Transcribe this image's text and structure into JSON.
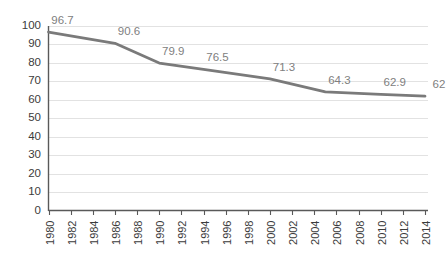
{
  "chart_data": {
    "type": "line",
    "title": "",
    "subtitle": "",
    "xlabel": "",
    "ylabel": "",
    "grid": true,
    "legend": false,
    "xlim": [
      1980,
      2014
    ],
    "ylim": [
      0,
      100
    ],
    "y_ticks": [
      0,
      10,
      20,
      30,
      40,
      50,
      60,
      70,
      80,
      90,
      100
    ],
    "y_tick_labels": [
      "0",
      "10",
      "20",
      "30",
      "40",
      "50",
      "60",
      "70",
      "80",
      "90",
      "100"
    ],
    "x_ticks": [
      1980,
      1982,
      1984,
      1986,
      1988,
      1990,
      1992,
      1994,
      1996,
      1998,
      2000,
      2002,
      2004,
      2006,
      2008,
      2010,
      2012,
      2014
    ],
    "x_tick_labels": [
      "1980",
      "1982",
      "1984",
      "1986",
      "1988",
      "1990",
      "1992",
      "1994",
      "1996",
      "1998",
      "2000",
      "2002",
      "2004",
      "2006",
      "2008",
      "2010",
      "2012",
      "2014"
    ],
    "x_tick_rotation": -90,
    "series": [
      {
        "name": "series-1",
        "color": "#7a7a7a",
        "x": [
          1980,
          1986,
          1990,
          1994,
          2000,
          2005,
          2010,
          2014
        ],
        "values": [
          96.7,
          90.6,
          79.9,
          76.5,
          71.3,
          64.3,
          62.9,
          62
        ],
        "point_labels": [
          "96.7",
          "90.6",
          "79.9",
          "76.5",
          "71.3",
          "64.3",
          "62.9",
          "62"
        ]
      }
    ],
    "label_color": "#808080",
    "gridline_color": "#e2e2e2",
    "axis_color": "#595959",
    "background_color": "#ffffff"
  }
}
